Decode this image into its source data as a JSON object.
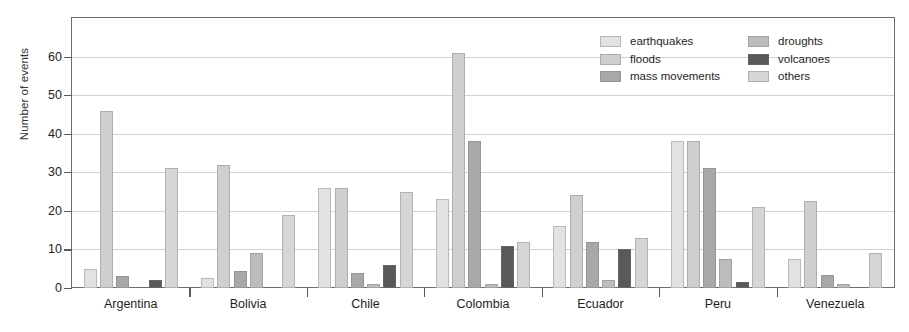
{
  "chart_data": {
    "type": "bar",
    "title": "",
    "subtitle": "",
    "xlabel": "",
    "ylabel": "Number of events",
    "ylim": [
      0,
      70
    ],
    "yticks": [
      0,
      10,
      20,
      30,
      40,
      50,
      60
    ],
    "ytick_labels": [
      "0",
      "10",
      "20",
      "30",
      "40",
      "50",
      "60"
    ],
    "grid": true,
    "grid_axis": "y",
    "legend_position": "top-right",
    "categories": [
      "Argentina",
      "Bolivia",
      "Chile",
      "Colombia",
      "Ecuador",
      "Peru",
      "Venezuela"
    ],
    "series": [
      {
        "name": "earthquakes",
        "color": "#e2e2e2",
        "values": [
          5,
          2.5,
          26,
          23,
          16,
          38,
          7.5
        ]
      },
      {
        "name": "floods",
        "color": "#cfcfcf",
        "values": [
          46,
          32,
          26,
          61,
          24,
          38,
          22.5
        ]
      },
      {
        "name": "mass movements",
        "color": "#a8a8a8",
        "values": [
          3,
          4.5,
          4,
          38,
          12,
          31,
          3.5
        ]
      },
      {
        "name": "droughts",
        "color": "#bcbcbc",
        "values": [
          0,
          9,
          1,
          1,
          2,
          7.5,
          1
        ]
      },
      {
        "name": "volcanoes",
        "color": "#595959",
        "values": [
          2,
          0,
          6,
          11,
          10,
          1.5,
          0
        ]
      },
      {
        "name": "others",
        "color": "#d6d6d6",
        "values": [
          31,
          19,
          25,
          12,
          13,
          21,
          9
        ]
      }
    ]
  },
  "legend": {
    "columns": [
      {
        "items": [
          {
            "label": "earthquakes",
            "series": "earthquakes"
          },
          {
            "label": "floods",
            "series": "floods"
          },
          {
            "label": "mass movements",
            "series": "mass movements"
          }
        ]
      },
      {
        "items": [
          {
            "label": "droughts",
            "series": "droughts"
          },
          {
            "label": "volcanoes",
            "series": "volcanoes"
          },
          {
            "label": "others",
            "series": "others"
          }
        ]
      }
    ]
  },
  "colors": {
    "axis": "#6d6d6d",
    "grid": "#d2d2d2",
    "text": "#1e1e1e",
    "background": "#ffffff"
  }
}
